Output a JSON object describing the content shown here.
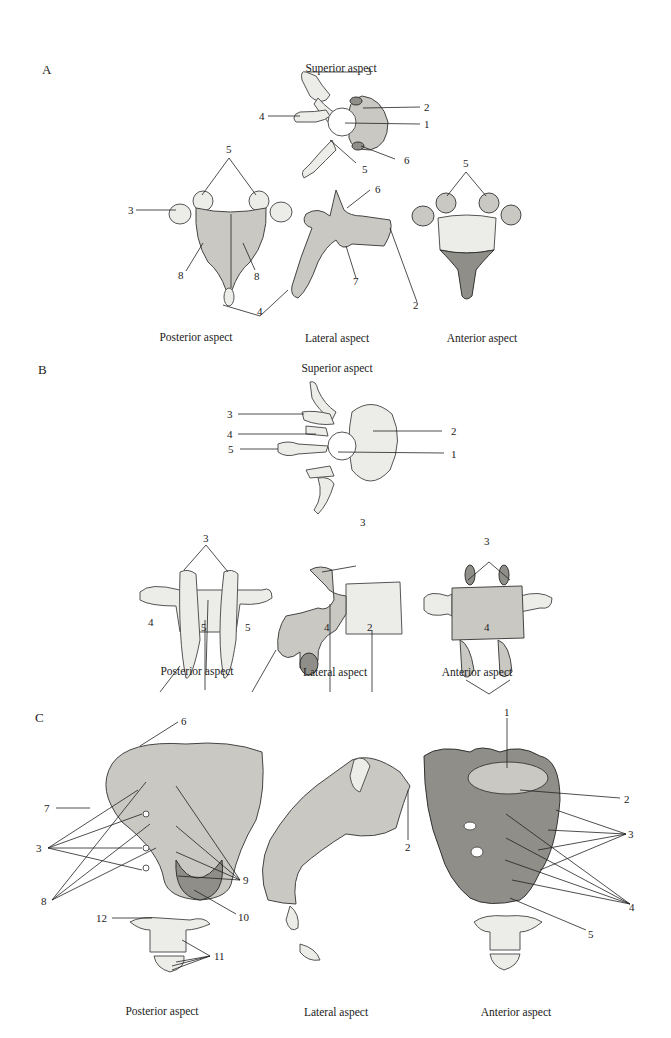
{
  "figure": {
    "panels": [
      {
        "letter": "A",
        "superior_caption": "Superior aspect",
        "captions": [
          "Posterior aspect",
          "Lateral aspect",
          "Anterior aspect"
        ],
        "labels": {
          "sup_3": "3",
          "sup_2": "2",
          "sup_4": "4",
          "sup_1": "1",
          "sup_6": "6",
          "sup_5": "5",
          "post_5": "5",
          "post_3": "3",
          "post_8a": "8",
          "post_8b": "8",
          "shared_4": "4",
          "lat_6": "6",
          "lat_7": "7",
          "lat_2": "2",
          "ant_5": "5"
        }
      },
      {
        "letter": "B",
        "superior_caption": "Superior aspect",
        "captions": [
          "Posterior aspect",
          "Lateral aspect",
          "Anterior aspect"
        ],
        "labels": {
          "sup_3": "3",
          "sup_4": "4",
          "sup_5": "5",
          "sup_2": "2",
          "sup_1": "1",
          "post_3": "3",
          "post_4": "4",
          "post_5": "5",
          "lat_3": "3",
          "lat_5": "5",
          "lat_4": "4",
          "lat_2": "2",
          "ant_3": "3",
          "ant_4": "4"
        }
      },
      {
        "letter": "C",
        "captions": [
          "Posterior aspect",
          "Lateral aspect",
          "Anterior aspect"
        ],
        "labels": {
          "post_6": "6",
          "post_7": "7",
          "post_3": "3",
          "post_8": "8",
          "post_9": "9",
          "post_10": "10",
          "post_12": "12",
          "post_11": "11",
          "lat_2": "2",
          "ant_1": "1",
          "ant_2": "2",
          "ant_3": "3",
          "ant_4": "4",
          "ant_5": "5"
        }
      }
    ]
  }
}
